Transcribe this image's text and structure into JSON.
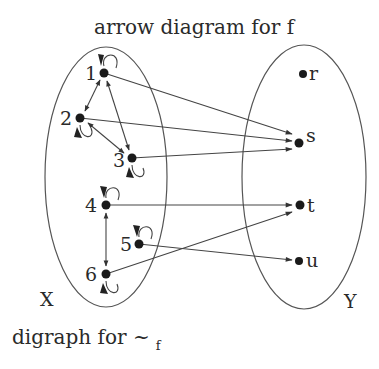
{
  "title": "arrow diagram for f",
  "caption": {
    "main": "digraph for ~",
    "subscript": "f"
  },
  "sets": {
    "domain": {
      "label": "X",
      "elements": [
        "1",
        "2",
        "3",
        "4",
        "5",
        "6"
      ]
    },
    "codomain": {
      "label": "Y",
      "elements": [
        "r",
        "s",
        "t",
        "u"
      ]
    }
  },
  "nodes": {
    "n1": {
      "label": "1",
      "x": 104,
      "y": 73
    },
    "n2": {
      "label": "2",
      "x": 80,
      "y": 118
    },
    "n3": {
      "label": "3",
      "x": 132,
      "y": 158
    },
    "n4": {
      "label": "4",
      "x": 106,
      "y": 205
    },
    "n5": {
      "label": "5",
      "x": 139,
      "y": 244
    },
    "n6": {
      "label": "6",
      "x": 106,
      "y": 274
    },
    "r": {
      "label": "r",
      "x": 303,
      "y": 74
    },
    "s": {
      "label": "s",
      "x": 299,
      "y": 142
    },
    "t": {
      "label": "t",
      "x": 299,
      "y": 205
    },
    "u": {
      "label": "u",
      "x": 299,
      "y": 260
    }
  },
  "function_f": [
    {
      "from": "1",
      "to": "s"
    },
    {
      "from": "2",
      "to": "s"
    },
    {
      "from": "3",
      "to": "s"
    },
    {
      "from": "4",
      "to": "t"
    },
    {
      "from": "5",
      "to": "u"
    },
    {
      "from": "6",
      "to": "t"
    }
  ],
  "relation_tilde_f": {
    "self_loops": [
      "1",
      "2",
      "3",
      "4",
      "5",
      "6"
    ],
    "bidirectional_edges": [
      {
        "a": "1",
        "b": "2"
      },
      {
        "a": "1",
        "b": "3"
      },
      {
        "a": "2",
        "b": "3"
      },
      {
        "a": "4",
        "b": "6"
      }
    ]
  },
  "colors": {
    "ink": "#1a1a1a",
    "line": "#444444",
    "background": "#ffffff"
  }
}
